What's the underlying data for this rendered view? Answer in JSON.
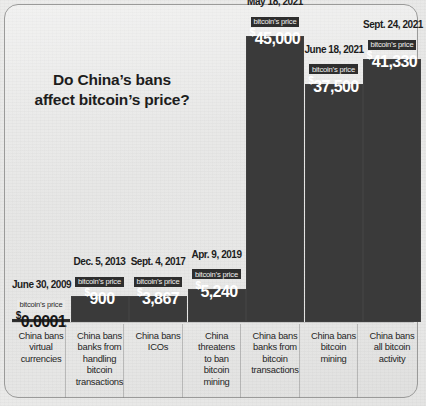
{
  "title": "Do China’s bans\naffect bitcoin’s price?",
  "title_line1": "Do China’s bans",
  "title_line2": "affect bitcoin’s price?",
  "price_caption": "bitcoin’s price",
  "colors": {
    "bar": "#3a3a3a",
    "background": "#eaeae9",
    "text": "#1d1d1d",
    "bar_text": "#ffffff",
    "border": "#9a9a99"
  },
  "chart_data": {
    "type": "bar",
    "title": "Do China’s bans affect bitcoin’s price?",
    "xlabel": "",
    "ylabel": "bitcoin’s price (USD)",
    "ylim": [
      0,
      45000
    ],
    "grid": false,
    "legend": null,
    "categories": [
      "June 30, 2009",
      "Dec. 5, 2013",
      "Sept. 4, 2017",
      "Apr. 9, 2019",
      "May 18, 2021",
      "June 18, 2021",
      "Sept. 24, 2021"
    ],
    "values": [
      0.0001,
      900,
      3867,
      5240,
      45000,
      37500,
      41330
    ],
    "value_labels": [
      "$0.0001",
      "$900",
      "$3,867",
      "$5,240",
      "$45,000",
      "$37,500",
      "$41,330"
    ],
    "annotations": [
      "China bans virtual currencies",
      "China bans banks from handling bitcoin transactions",
      "China bans ICOs",
      "China threatens to ban bitcoin mining",
      "China bans banks from bitcoin transactions",
      "China bans bitcoin mining",
      "China bans all bitcoin activity"
    ]
  },
  "bars": [
    {
      "date": "June 30, 2009",
      "price_label": "bitcoin’s price",
      "currency": "$",
      "amount": "0.0001",
      "value": 0.0001,
      "caption": "China bans\nvirtual\ncurrencies",
      "caption_lines": [
        "China bans",
        "virtual",
        "currencies"
      ],
      "style": "light"
    },
    {
      "date": "Dec. 5, 2013",
      "price_label": "bitcoin’s price",
      "currency": "$",
      "amount": "900",
      "value": 900,
      "caption": "China bans\nbanks from\nhandling\nbitcoin\ntransactions",
      "caption_lines": [
        "China bans",
        "banks from",
        "handling",
        "bitcoin",
        "transactions"
      ],
      "style": "dark"
    },
    {
      "date": "Sept. 4, 2017",
      "price_label": "bitcoin’s price",
      "currency": "$",
      "amount": "3,867",
      "value": 3867,
      "caption": "China bans\nICOs",
      "caption_lines": [
        "China bans",
        "ICOs"
      ],
      "style": "dark"
    },
    {
      "date": "Apr. 9, 2019",
      "price_label": "bitcoin’s price",
      "currency": "$",
      "amount": "5,240",
      "value": 5240,
      "caption": "China\nthreatens\nto ban\nbitcoin\nmining",
      "caption_lines": [
        "China",
        "threatens",
        "to ban",
        "bitcoin",
        "mining"
      ],
      "style": "dark"
    },
    {
      "date": "May 18, 2021",
      "price_label": "bitcoin’s price",
      "currency": "$",
      "amount": "45,000",
      "value": 45000,
      "caption": "China bans\nbanks from\nbitcoin\ntransactions",
      "caption_lines": [
        "China bans",
        "banks from",
        "bitcoin",
        "transactions"
      ],
      "style": "dark"
    },
    {
      "date": "June 18, 2021",
      "price_label": "bitcoin’s price",
      "currency": "$",
      "amount": "37,500",
      "value": 37500,
      "caption": "China bans\nbitcoin\nmining",
      "caption_lines": [
        "China bans",
        "bitcoin",
        "mining"
      ],
      "style": "dark"
    },
    {
      "date": "Sept. 24, 2021",
      "price_label": "bitcoin’s price",
      "currency": "$",
      "amount": "41,330",
      "value": 41330,
      "caption": "China bans\nall bitcoin\nactivity",
      "caption_lines": [
        "China bans",
        "all bitcoin",
        "activity"
      ],
      "style": "dark"
    }
  ]
}
